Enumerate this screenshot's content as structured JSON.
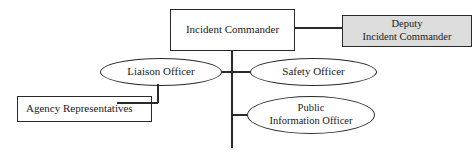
{
  "diagram": {
    "type": "org-chart",
    "background": "#ffffff",
    "line_color": "#2a2a2a",
    "text_color": "#1a1a1a",
    "nodes": {
      "incident_commander": {
        "label": "Incident Commander",
        "shape": "rect",
        "fill": "#ffffff"
      },
      "deputy_incident_commander": {
        "line1": "Deputy",
        "line2": "Incident Commander",
        "shape": "rect",
        "fill": "#dcdcdc"
      },
      "liaison_officer": {
        "label": "Liaison Officer",
        "shape": "ellipse",
        "fill": "#ffffff"
      },
      "safety_officer": {
        "label": "Safety Officer",
        "shape": "ellipse",
        "fill": "#ffffff"
      },
      "agency_representatives": {
        "label": "Agency Representatives",
        "shape": "rect",
        "fill": "#ffffff"
      },
      "public_information_officer": {
        "line1": "Public",
        "line2": "Information Officer",
        "shape": "ellipse",
        "fill": "#ffffff"
      }
    },
    "edges": [
      {
        "from": "incident_commander",
        "to": "deputy_incident_commander",
        "style": "horizontal"
      },
      {
        "from": "incident_commander",
        "to": "command-staff-trunk",
        "style": "vertical"
      },
      {
        "from": "liaison_officer",
        "to": "command-staff-trunk",
        "style": "horizontal"
      },
      {
        "from": "safety_officer",
        "to": "command-staff-trunk",
        "style": "horizontal"
      },
      {
        "from": "public_information_officer",
        "to": "command-staff-trunk",
        "style": "horizontal"
      },
      {
        "from": "liaison_officer",
        "to": "agency_representatives",
        "style": "elbow"
      }
    ]
  }
}
